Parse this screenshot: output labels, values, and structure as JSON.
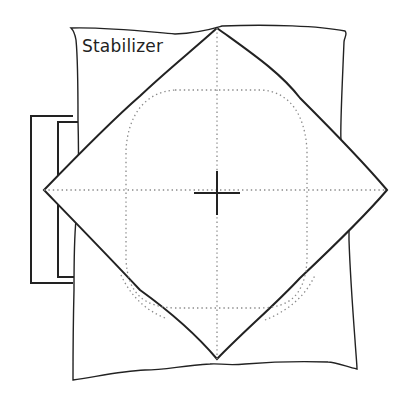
{
  "diagram": {
    "title": "Stabilizer",
    "labels": {
      "stabilizer": "Stabilizer"
    },
    "elements": [
      {
        "name": "stabilizer-sheet",
        "description": "Wavy-edged rectangular stabilizer sheet"
      },
      {
        "name": "hoop-bracket",
        "description": "Embroidery hoop bracket on the left side"
      },
      {
        "name": "fabric-diamond",
        "description": "Square fabric rotated 45 degrees, placed over stabilizer"
      },
      {
        "name": "placement-guide",
        "description": "Dotted rounded-square design area outline"
      },
      {
        "name": "center-axes",
        "description": "Dotted horizontal and vertical center lines"
      },
      {
        "name": "center-crosshair",
        "description": "Center registration cross mark"
      }
    ],
    "colors": {
      "line": "#222222",
      "dotted": "#8a8a8a",
      "background": "#ffffff"
    }
  }
}
